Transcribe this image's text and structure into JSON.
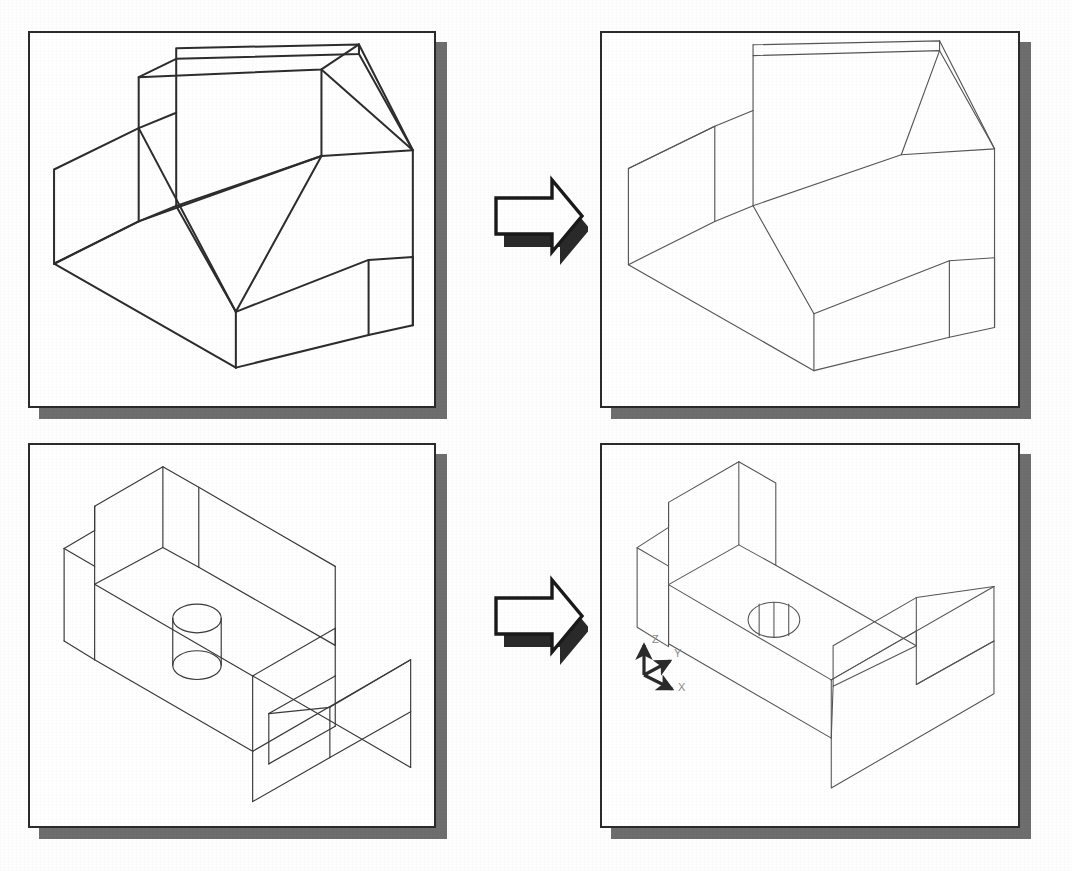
{
  "figure": {
    "background_color": "#ffffff",
    "line_color_wireframe": "#2d2d2d",
    "line_color_hidden_removed": "#555555",
    "panel_border_color": "#2b2b2b",
    "panel_shadow_color": "#6e6e6e",
    "arrow_fill": "#ffffff",
    "arrow_stroke": "#1a1a1a",
    "arrow_shadow": "#2a2a2a"
  },
  "panels": [
    {
      "id": "top-left",
      "name": "wireframe-block-before",
      "label": "Wireframe display of notched block",
      "x": 28,
      "y": 31,
      "w": 408,
      "h": 377,
      "shadow_offset": 11,
      "line_width": 2.0,
      "stroke": "#2d2d2d"
    },
    {
      "id": "top-right",
      "name": "hidden-line-block-after",
      "label": "Hidden lines removed display of notched block",
      "x": 600,
      "y": 31,
      "w": 420,
      "h": 377,
      "shadow_offset": 11,
      "line_width": 1.0,
      "stroke": "#555555"
    },
    {
      "id": "bottom-left",
      "name": "wireframe-bracket-before",
      "label": "Wireframe display of L-bracket with through hole",
      "x": 28,
      "y": 443,
      "w": 408,
      "h": 385,
      "shadow_offset": 11,
      "line_width": 1.1,
      "stroke": "#3a3a3a"
    },
    {
      "id": "bottom-right",
      "name": "hidden-line-bracket-after",
      "label": "Hidden lines removed display of L-bracket with UCS icon",
      "x": 600,
      "y": 443,
      "w": 420,
      "h": 385,
      "shadow_offset": 11,
      "line_width": 1.0,
      "stroke": "#555555"
    }
  ],
  "arrows": [
    {
      "name": "transform-arrow-top",
      "x": 482,
      "y": 172,
      "w": 106,
      "h": 96
    },
    {
      "name": "transform-arrow-bottom",
      "x": 482,
      "y": 572,
      "w": 106,
      "h": 96
    }
  ],
  "ucs_icon": {
    "name": "ucs-axis-icon",
    "x": 632,
    "y": 622,
    "axis_labels": {
      "x": "X",
      "y": "Y",
      "z": "Z"
    },
    "label_color": "#777777",
    "axis_color": "#333333",
    "origin": {
      "x": 40,
      "y": 74
    }
  },
  "geometry": {
    "block_wireframe": {
      "name": "notched-block-wireframe",
      "polylines": [
        [
          [
            25,
            236
          ],
          [
            25,
            138
          ],
          [
            113,
            95
          ],
          [
            113,
            192
          ]
        ],
        [
          [
            25,
            138
          ],
          [
            113,
            95
          ]
        ],
        [
          [
            113,
            95
          ],
          [
            152,
            79
          ],
          [
            152,
            23
          ],
          [
            113,
            42
          ],
          [
            113,
            95
          ]
        ],
        [
          [
            152,
            23
          ],
          [
            342,
            18
          ],
          [
            342,
            8
          ],
          [
            152,
            12
          ],
          [
            152,
            23
          ]
        ],
        [
          [
            342,
            18
          ],
          [
            398,
            118
          ],
          [
            398,
            229
          ],
          [
            342,
            18
          ]
        ],
        [
          [
            113,
            42
          ],
          [
            303,
            34
          ],
          [
            342,
            8
          ]
        ],
        [
          [
            303,
            34
          ],
          [
            303,
            124
          ],
          [
            113,
            192
          ],
          [
            113,
            42
          ]
        ],
        [
          [
            303,
            124
          ],
          [
            398,
            118
          ]
        ],
        [
          [
            113,
            192
          ],
          [
            25,
            236
          ]
        ],
        [
          [
            25,
            236
          ],
          [
            214,
            344
          ],
          [
            398,
            229
          ]
        ],
        [
          [
            214,
            344
          ],
          [
            214,
            286
          ]
        ],
        [
          [
            214,
            286
          ],
          [
            303,
            124
          ]
        ],
        [
          [
            214,
            286
          ],
          [
            352,
            232
          ],
          [
            398,
            229
          ]
        ],
        [
          [
            352,
            232
          ],
          [
            352,
            310
          ],
          [
            214,
            344
          ]
        ],
        [
          [
            352,
            310
          ],
          [
            398,
            300
          ]
        ],
        [
          [
            398,
            229
          ],
          [
            398,
            300
          ]
        ],
        [
          [
            303,
            34
          ],
          [
            398,
            118
          ]
        ],
        [
          [
            113,
            192
          ],
          [
            152,
            176
          ],
          [
            152,
            79
          ]
        ],
        [
          [
            152,
            176
          ],
          [
            303,
            124
          ]
        ],
        [
          [
            113,
            95
          ],
          [
            214,
            286
          ]
        ],
        [
          [
            342,
            8
          ],
          [
            398,
            118
          ]
        ],
        [
          [
            398,
            300
          ],
          [
            352,
            310
          ]
        ]
      ]
    },
    "block_hidden": {
      "name": "notched-block-hidden-removed",
      "polylines": [
        [
          [
            25,
            236
          ],
          [
            25,
            138
          ],
          [
            113,
            95
          ],
          [
            152,
            79
          ],
          [
            152,
            23
          ],
          [
            342,
            18
          ],
          [
            398,
            118
          ],
          [
            398,
            300
          ],
          [
            352,
            310
          ],
          [
            214,
            344
          ],
          [
            25,
            236
          ]
        ],
        [
          [
            25,
            138
          ],
          [
            113,
            95
          ]
        ],
        [
          [
            152,
            23
          ],
          [
            342,
            8
          ],
          [
            398,
            118
          ]
        ],
        [
          [
            342,
            18
          ],
          [
            342,
            8
          ]
        ],
        [
          [
            152,
            23
          ],
          [
            152,
            12
          ],
          [
            342,
            8
          ]
        ],
        [
          [
            113,
            95
          ],
          [
            113,
            192
          ],
          [
            25,
            236
          ]
        ],
        [
          [
            113,
            192
          ],
          [
            152,
            176
          ],
          [
            152,
            79
          ]
        ],
        [
          [
            152,
            176
          ],
          [
            303,
            124
          ],
          [
            342,
            18
          ]
        ],
        [
          [
            303,
            124
          ],
          [
            398,
            118
          ]
        ],
        [
          [
            152,
            176
          ],
          [
            214,
            286
          ],
          [
            214,
            344
          ]
        ],
        [
          [
            214,
            286
          ],
          [
            352,
            232
          ],
          [
            398,
            229
          ]
        ],
        [
          [
            352,
            232
          ],
          [
            352,
            310
          ]
        ],
        [
          [
            398,
            229
          ],
          [
            398,
            300
          ]
        ]
      ]
    },
    "bracket_wireframe": {
      "name": "l-bracket-wireframe",
      "polylines": [
        [
          [
            148,
            17
          ],
          [
            188,
            40
          ],
          [
            188,
            129
          ],
          [
            148,
            107
          ],
          [
            148,
            17
          ]
        ],
        [
          [
            148,
            17
          ],
          [
            72,
            61
          ],
          [
            72,
            88
          ],
          [
            38,
            108
          ],
          [
            38,
            211
          ],
          [
            72,
            232
          ],
          [
            72,
            148
          ]
        ],
        [
          [
            72,
            61
          ],
          [
            72,
            148
          ],
          [
            148,
            107
          ]
        ],
        [
          [
            38,
            108
          ],
          [
            72,
            88
          ]
        ],
        [
          [
            188,
            40
          ],
          [
            188,
            129
          ]
        ],
        [
          [
            148,
            107
          ],
          [
            188,
            129
          ]
        ],
        [
          [
            38,
            211
          ],
          [
            72,
            232
          ]
        ],
        [
          [
            72,
            232
          ],
          [
            248,
            334
          ],
          [
            248,
            390
          ]
        ],
        [
          [
            72,
            148
          ],
          [
            248,
            250
          ],
          [
            248,
            334
          ]
        ],
        [
          [
            248,
            250
          ],
          [
            340,
            197
          ]
        ],
        [
          [
            188,
            129
          ],
          [
            340,
            197
          ]
        ],
        [
          [
            340,
            197
          ],
          [
            340,
            150
          ]
        ],
        [
          [
            188,
            40
          ],
          [
            340,
            150
          ]
        ],
        [
          [
            248,
            250
          ],
          [
            422,
            352
          ]
        ],
        [
          [
            340,
            197
          ],
          [
            340,
            240
          ]
        ],
        [
          [
            248,
            334
          ],
          [
            422,
            232
          ]
        ],
        [
          [
            422,
            232
          ],
          [
            422,
            290
          ]
        ],
        [
          [
            340,
            240
          ],
          [
            266,
            282
          ]
        ],
        [
          [
            266,
            282
          ],
          [
            266,
            338
          ]
        ],
        [
          [
            248,
            390
          ],
          [
            330,
            344
          ]
        ],
        [
          [
            330,
            344
          ],
          [
            330,
            288
          ]
        ],
        [
          [
            330,
            288
          ],
          [
            266,
            252
          ]
        ],
        [
          [
            266,
            252
          ],
          [
            266,
            308
          ]
        ],
        [
          [
            330,
            288
          ],
          [
            422,
            235
          ]
        ],
        [
          [
            422,
            235
          ],
          [
            422,
            292
          ]
        ],
        [
          [
            330,
            344
          ],
          [
            422,
            292
          ]
        ],
        [
          [
            160,
            184
          ],
          [
            160,
            238
          ]
        ],
        [
          [
            211,
            184
          ],
          [
            211,
            238
          ]
        ]
      ],
      "ellipses": [
        {
          "cx": 186,
          "cy": 186,
          "rx": 26,
          "ry": 15
        },
        {
          "cx": 186,
          "cy": 238,
          "rx": 26,
          "ry": 15
        }
      ]
    },
    "bracket_hidden": {
      "name": "l-bracket-hidden-removed",
      "polylines": [
        [
          [
            148,
            17
          ],
          [
            188,
            40
          ],
          [
            188,
            129
          ],
          [
            340,
            216
          ],
          [
            340,
            258
          ],
          [
            422,
            211
          ],
          [
            422,
            268
          ],
          [
            248,
            370
          ],
          [
            248,
            316
          ],
          [
            72,
            214
          ],
          [
            72,
            130
          ],
          [
            38,
            110
          ],
          [
            38,
            196
          ],
          [
            72,
            217
          ]
        ],
        [
          [
            148,
            17
          ],
          [
            72,
            61
          ],
          [
            72,
            130
          ]
        ],
        [
          [
            72,
            61
          ],
          [
            72,
            88
          ],
          [
            38,
            110
          ]
        ],
        [
          [
            148,
            17
          ],
          [
            148,
            107
          ],
          [
            188,
            129
          ]
        ],
        [
          [
            148,
            107
          ],
          [
            72,
            150
          ]
        ],
        [
          [
            72,
            150
          ],
          [
            72,
            214
          ]
        ],
        [
          [
            248,
            316
          ],
          [
            340,
            258
          ]
        ],
        [
          [
            422,
            211
          ],
          [
            340,
            164
          ]
        ],
        [
          [
            340,
            164
          ],
          [
            250,
            216
          ]
        ],
        [
          [
            250,
            216
          ],
          [
            250,
            260
          ]
        ],
        [
          [
            250,
            260
          ],
          [
            340,
            216
          ]
        ],
        [
          [
            340,
            164
          ],
          [
            340,
            216
          ]
        ],
        [
          [
            248,
            370
          ],
          [
            248,
            316
          ]
        ]
      ],
      "hole": {
        "cx": 186,
        "cy": 188,
        "rx": 27,
        "ry": 19,
        "tessellation_lines": 3
      }
    }
  }
}
